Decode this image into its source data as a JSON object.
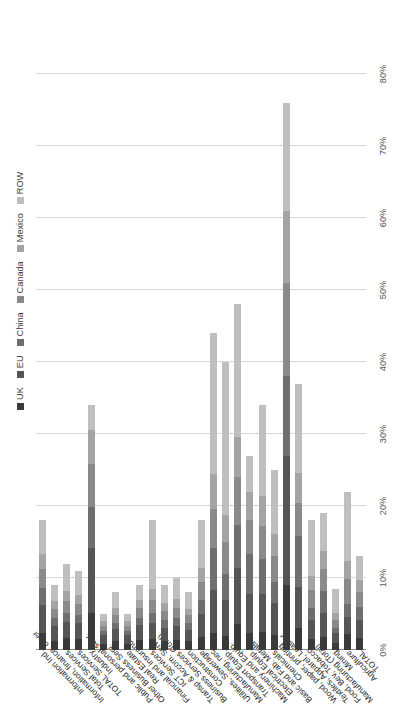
{
  "chart": {
    "type": "bar",
    "title": "",
    "xlabel": "",
    "ylabel": ""
  },
  "legend": {
    "position": "top-left",
    "items": [
      {
        "label": "UK",
        "color": "#3a3a3a"
      },
      {
        "label": "EU",
        "color": "#555555"
      },
      {
        "label": "China",
        "color": "#6f6f6f"
      },
      {
        "label": "Canada",
        "color": "#8a8a8a"
      },
      {
        "label": "Mexico",
        "color": "#a4a4a4"
      },
      {
        "label": "ROW",
        "color": "#bfbfbf"
      }
    ]
  },
  "axis": {
    "ticks": [
      "0%",
      "10%",
      "20%",
      "30%",
      "40%",
      "50%",
      "60%",
      "70%",
      "80%"
    ],
    "tick_values": [
      0,
      10,
      20,
      30,
      40,
      50,
      60,
      70,
      80
    ],
    "min": 0,
    "max": 85,
    "grid": true
  },
  "chart_data": {
    "type": "bar",
    "orientation": "horizontal",
    "stacked": true,
    "title": "",
    "xlabel": "",
    "ylabel": "",
    "xlim": [
      0,
      85
    ],
    "grid": true,
    "legend_position": "top-left",
    "tick_labels": [
      "0%",
      "10%",
      "20%",
      "30%",
      "40%",
      "50%",
      "60%",
      "70%",
      "80%"
    ],
    "series_names": [
      "UK",
      "EU",
      "China",
      "Canada",
      "Mexico",
      "ROW"
    ],
    "series_colors": [
      "#3a3a3a",
      "#555555",
      "#6f6f6f",
      "#8a8a8a",
      "#a4a4a4",
      "#bfbfbf"
    ],
    "categories": [
      "TOTAL",
      "Agriculture",
      "Mining",
      "Manufacturing (Total)",
      "Food, Bev, Tobacco",
      "Textiles, Apparel, Leather",
      "Wood, paper, printing",
      "Chemicals",
      "Basic and Fab. Metals",
      "Electrical Equip.",
      "Machinery and Equip.",
      "Transport Equip.",
      "Manufacturing, nec",
      "Utilities, Sewerage",
      "Construction",
      "Business Services (Total)",
      "Transp & Accom. Serv",
      "ICT Services",
      "Financial and insurance",
      "Real Estate",
      "Other Business Serv.",
      "Public and personal serv.",
      "Industry",
      "TOTAL Services",
      "Total Services",
      "Information, finance, other",
      "Information Ind."
    ],
    "series": [
      {
        "name": "UK",
        "color": "#3a3a3a",
        "values": [
          1.6,
          2.2,
          1.0,
          1.8,
          1.5,
          3.0,
          9.0,
          2.1,
          2.5,
          2.4,
          3.6,
          2.0,
          2.4,
          1.8,
          1.2,
          1.4,
          1.3,
          1.5,
          1.4,
          0.9,
          1.2,
          0.9,
          5.2,
          1.5,
          1.6,
          1.3,
          2.4
        ]
      },
      {
        "name": "EU",
        "color": "#555555",
        "values": [
          2.6,
          2.4,
          1.3,
          3.4,
          2.6,
          5.8,
          18.0,
          4.4,
          5.3,
          5.4,
          7.8,
          5.0,
          6.0,
          3.2,
          1.6,
          2.0,
          1.8,
          2.3,
          2.1,
          1.2,
          1.7,
          1.2,
          9.0,
          2.2,
          2.3,
          2.0,
          3.9
        ]
      },
      {
        "name": "China",
        "color": "#6f6f6f",
        "values": [
          1.8,
          1.8,
          0.8,
          3.0,
          1.8,
          7.0,
          11.0,
          3.0,
          4.8,
          5.6,
          6.0,
          3.6,
          5.8,
          2.0,
          0.9,
          1.1,
          1.0,
          1.4,
          1.0,
          0.6,
          0.9,
          0.6,
          5.6,
          1.2,
          1.3,
          1.1,
          2.3
        ]
      },
      {
        "name": "Canada",
        "color": "#8a8a8a",
        "values": [
          2.0,
          3.4,
          1.1,
          3.0,
          2.4,
          4.6,
          13.0,
          3.6,
          4.6,
          4.6,
          6.6,
          4.4,
          5.4,
          2.4,
          1.1,
          1.4,
          1.3,
          1.8,
          1.3,
          0.7,
          1.1,
          0.7,
          6.0,
          1.5,
          1.6,
          1.3,
          2.6
        ]
      },
      {
        "name": "Mexico",
        "color": "#a4a4a4",
        "values": [
          1.7,
          2.6,
          0.9,
          2.6,
          2.0,
          4.2,
          10.0,
          3.0,
          4.2,
          4.0,
          5.6,
          3.8,
          4.8,
          2.0,
          0.9,
          1.2,
          1.1,
          1.5,
          1.1,
          0.6,
          0.9,
          0.6,
          4.8,
          1.3,
          1.4,
          1.1,
          2.2
        ]
      },
      {
        "name": "ROW",
        "color": "#bfbfbf",
        "values": [
          3.3,
          9.6,
          3.4,
          5.2,
          7.7,
          12.4,
          15.0,
          8.9,
          12.6,
          5.0,
          18.4,
          21.2,
          19.6,
          6.6,
          2.3,
          2.9,
          2.6,
          9.5,
          2.1,
          1.0,
          2.2,
          1.0,
          3.4,
          3.3,
          3.8,
          2.2,
          4.6
        ]
      }
    ]
  }
}
